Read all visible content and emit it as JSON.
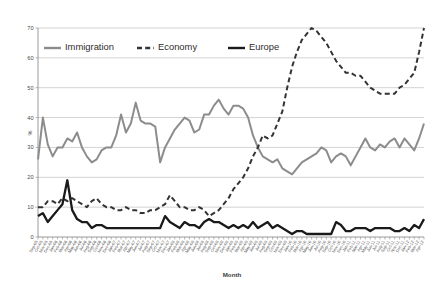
{
  "chart_data": {
    "type": "line",
    "title": "",
    "xlabel": "Month",
    "ylabel": "%",
    "ylim": [
      0,
      70
    ],
    "ytickstep": 10,
    "yticks": [
      0,
      10,
      20,
      30,
      40,
      50,
      60,
      70
    ],
    "grid": true,
    "legend_position": "top-left-inside",
    "categories": [
      "Sep-05",
      "Oct-05",
      "Nov-05",
      "Dec-05",
      "Jan-06",
      "Feb-06",
      "Mar-06",
      "Apr-06",
      "May-06",
      "Jun-06",
      "Jul-06",
      "Aug-06",
      "Sep-06",
      "Oct-06",
      "Nov-06",
      "Dec-06",
      "Jan-07",
      "Feb-07",
      "Mar-07",
      "Apr-07",
      "May-07",
      "Jun-07",
      "Jul-07",
      "Aug-07",
      "Sep-07",
      "Oct-07",
      "Nov-07",
      "Dec-07",
      "Jan-08",
      "Feb-08",
      "Mar-08",
      "Apr-08",
      "May-08",
      "Jun-08",
      "Jul-08",
      "Aug-08",
      "Sep-08",
      "Oct-08",
      "Nov-08",
      "Dec-08",
      "Jan-09",
      "Feb-09",
      "Mar-09",
      "Apr-09",
      "May-09",
      "Jun-09",
      "Jul-09",
      "Aug-09",
      "Sep-09",
      "Oct-09",
      "Nov-09",
      "Dec-09",
      "Jan-10",
      "Feb-10",
      "Mar-10",
      "Apr-10",
      "May-10",
      "Jun-10",
      "Jul-10",
      "Aug-10",
      "Sep-10",
      "Oct-10",
      "Nov-10",
      "Dec-10",
      "Jan-11",
      "Feb-11",
      "Mar-11",
      "Apr-11",
      "May-11",
      "Jun-11",
      "Jul-11",
      "Aug-11",
      "Sep-11",
      "Oct-11",
      "Nov-11",
      "Dec-11",
      "Jan-12",
      "Feb-12",
      "Mar-12",
      "Apr-12"
    ],
    "series": [
      {
        "name": "Immigration",
        "color": "#8c8c8c",
        "style": "solid",
        "width": 2.0,
        "values": [
          26,
          40,
          31,
          27,
          30,
          30,
          33,
          32,
          35,
          30,
          27,
          25,
          26,
          29,
          30,
          30,
          34,
          41,
          35,
          38,
          45,
          39,
          38,
          38,
          37,
          25,
          30,
          33,
          36,
          38,
          40,
          39,
          35,
          36,
          41,
          41,
          44,
          46,
          43,
          41,
          44,
          44,
          43,
          40,
          34,
          30,
          27,
          26,
          25,
          26,
          23,
          22,
          21,
          23,
          25,
          26,
          27,
          28,
          30,
          29,
          25,
          27,
          28,
          27,
          24,
          27,
          30,
          33,
          30,
          29,
          31,
          30,
          32,
          33,
          30,
          33,
          31,
          29,
          33,
          38
        ]
      },
      {
        "name": "Economy",
        "color": "#333333",
        "style": "dashed",
        "width": 2.0,
        "values": [
          10,
          10,
          12,
          12,
          11,
          13,
          12,
          13,
          12,
          11,
          10,
          12,
          13,
          11,
          10,
          10,
          9,
          9,
          10,
          9,
          9,
          8,
          8,
          9,
          9,
          10,
          11,
          14,
          12,
          10,
          10,
          9,
          9,
          10,
          9,
          7,
          8,
          9,
          11,
          13,
          16,
          18,
          20,
          23,
          27,
          30,
          34,
          33,
          34,
          38,
          42,
          50,
          57,
          62,
          66,
          68,
          70,
          69,
          67,
          65,
          62,
          59,
          57,
          55,
          55,
          54,
          54,
          52,
          50,
          49,
          48,
          48,
          48,
          48,
          50,
          51,
          53,
          55,
          62,
          70
        ]
      },
      {
        "name": "Europe",
        "color": "#1a1a1a",
        "style": "solid",
        "width": 2.3,
        "values": [
          7,
          8,
          5,
          7,
          9,
          11,
          19,
          9,
          6,
          5,
          5,
          3,
          4,
          4,
          3,
          3,
          3,
          3,
          3,
          3,
          3,
          3,
          3,
          3,
          3,
          3,
          7,
          5,
          4,
          3,
          5,
          4,
          4,
          3,
          5,
          6,
          5,
          5,
          4,
          3,
          4,
          3,
          4,
          3,
          5,
          3,
          4,
          5,
          3,
          4,
          3,
          2,
          1,
          2,
          2,
          1,
          1,
          1,
          1,
          1,
          1,
          5,
          4,
          2,
          2,
          3,
          3,
          3,
          2,
          3,
          3,
          3,
          3,
          2,
          2,
          3,
          2,
          4,
          3,
          6
        ]
      }
    ],
    "legend": [
      {
        "label": "Immigration",
        "color": "#8c8c8c",
        "style": "solid"
      },
      {
        "label": "Economy",
        "color": "#333333",
        "style": "dashed"
      },
      {
        "label": "Europe",
        "color": "#1a1a1a",
        "style": "solid"
      }
    ]
  }
}
